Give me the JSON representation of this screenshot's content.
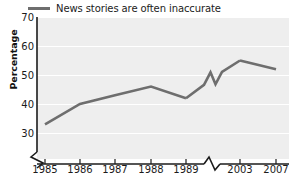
{
  "legend": {
    "label": "News stories are often inaccurate",
    "swatch_color": "#6e6e6e",
    "position": "top-left"
  },
  "axes": {
    "ylabel": "Percentage",
    "y_ticks": [
      "30",
      "40",
      "50",
      "60",
      "70"
    ],
    "x_ticks": [
      "1985",
      "1986",
      "1987",
      "1988",
      "1989",
      "2003",
      "2007"
    ],
    "y_axis_break": "zigzag-break-below-30",
    "x_axis_break": "zigzag-break-between-1989-and-2003"
  },
  "style": {
    "plot_background": "#eeeeee",
    "gridline_color": "#ffffff",
    "line_color": "#6e6e6e",
    "axis_color": "#1b1b1b",
    "text_color": "#1b1b1b"
  },
  "chart_data": {
    "type": "line",
    "title": "",
    "xlabel": "",
    "ylabel": "Percentage",
    "categories": [
      "1985",
      "1986",
      "1987",
      "1988",
      "1989",
      "2003",
      "2007"
    ],
    "series": [
      {
        "name": "News stories are often inaccurate",
        "values": [
          33,
          40,
          43,
          46,
          42,
          55,
          52
        ]
      }
    ],
    "ylim": [
      30,
      70
    ],
    "y_tick_step": 10,
    "grid": true,
    "legend_position": "top-left"
  }
}
